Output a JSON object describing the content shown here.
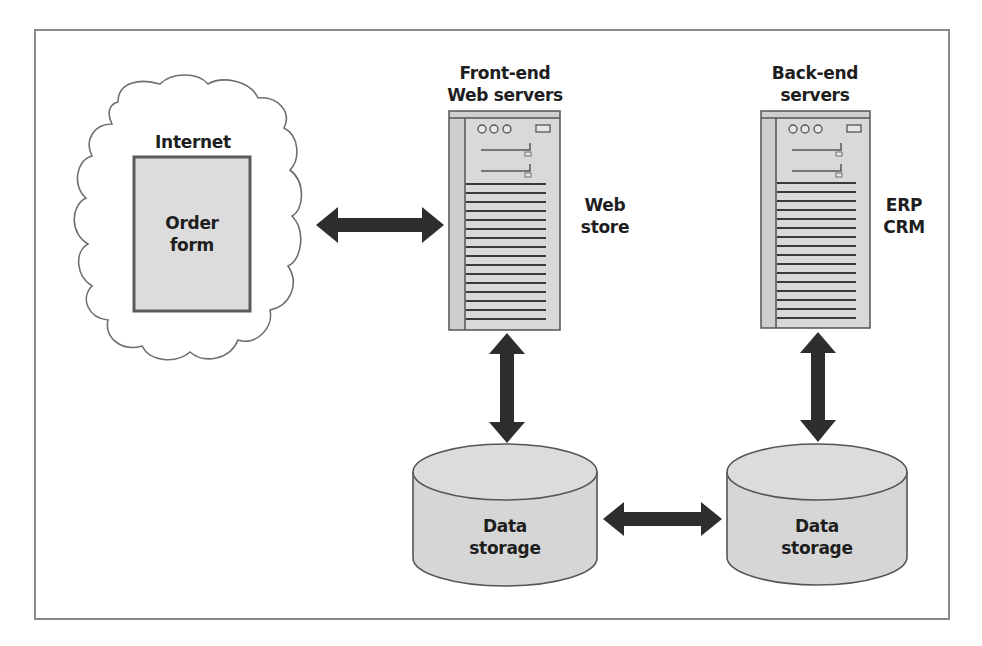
{
  "diagram": {
    "type": "architecture",
    "nodes": {
      "internet": {
        "label": "Internet"
      },
      "order_form": {
        "label_line1": "Order",
        "label_line2": "form"
      },
      "front_end": {
        "label_line1": "Front-end",
        "label_line2": "Web servers",
        "role_line1": "Web",
        "role_line2": "store"
      },
      "back_end": {
        "label_line1": "Back-end",
        "label_line2": "servers",
        "role_line1": "ERP",
        "role_line2": "CRM"
      },
      "storage_left": {
        "label_line1": "Data",
        "label_line2": "storage"
      },
      "storage_right": {
        "label_line1": "Data",
        "label_line2": "storage"
      }
    },
    "edges": [
      {
        "from": "order_form",
        "to": "front_end",
        "direction": "bidirectional"
      },
      {
        "from": "front_end",
        "to": "storage_left",
        "direction": "bidirectional"
      },
      {
        "from": "back_end",
        "to": "storage_right",
        "direction": "bidirectional"
      },
      {
        "from": "storage_left",
        "to": "storage_right",
        "direction": "bidirectional"
      }
    ],
    "colors": {
      "arrow": "#2e2e2e",
      "box_fill": "#d9d9d9",
      "server_fill": "#cfcfcf",
      "outline": "#555555",
      "frame": "#8a8a8a"
    }
  }
}
